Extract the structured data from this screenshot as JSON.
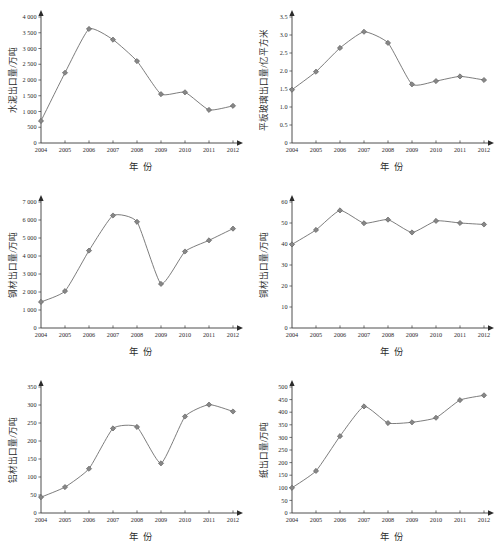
{
  "figure": {
    "background_color": "#ffffff",
    "line_color": "#6e6e6e",
    "marker_color": "#878787",
    "axis_color": "#3a3a3a",
    "panel_count": 6
  },
  "chart_data": [
    {
      "type": "line",
      "title": "",
      "xlabel": "年 份",
      "ylabel": "水泥出口量/万吨",
      "categories": [
        "2004",
        "2005",
        "2006",
        "2007",
        "2008",
        "2009",
        "2010",
        "2011",
        "2012"
      ],
      "values": [
        700,
        2230,
        3620,
        3280,
        2600,
        1550,
        1610,
        1050,
        1180
      ],
      "yticks": [
        "0",
        "500",
        "1 000",
        "1 500",
        "2 000",
        "2 500",
        "3 000",
        "3 500",
        "4 000"
      ],
      "ytick_values": [
        0,
        500,
        1000,
        1500,
        2000,
        2500,
        3000,
        3500,
        4000
      ],
      "ylim": [
        0,
        4000
      ],
      "grid": false,
      "legend": "none"
    },
    {
      "type": "line",
      "title": "",
      "xlabel": "年 份",
      "ylabel": "平板玻璃出口量/亿平方米",
      "categories": [
        "2004",
        "2005",
        "2006",
        "2007",
        "2008",
        "2009",
        "2010",
        "2011",
        "2012"
      ],
      "values": [
        1.48,
        1.98,
        2.64,
        3.09,
        2.78,
        1.63,
        1.72,
        1.85,
        1.75
      ],
      "yticks": [
        "0",
        "0.5",
        "1.0",
        "1.5",
        "2.0",
        "2.5",
        "3.0",
        "3.5"
      ],
      "ytick_values": [
        0,
        0.5,
        1.0,
        1.5,
        2.0,
        2.5,
        3.0,
        3.5
      ],
      "ylim": [
        0,
        3.5
      ],
      "grid": false,
      "legend": "none"
    },
    {
      "type": "line",
      "title": "",
      "xlabel": "年 份",
      "ylabel": "钢材出口量/万吨",
      "categories": [
        "2004",
        "2005",
        "2006",
        "2007",
        "2008",
        "2009",
        "2010",
        "2011",
        "2012"
      ],
      "values": [
        1450,
        2050,
        4300,
        6250,
        5900,
        2450,
        4250,
        4870,
        5520
      ],
      "yticks": [
        "0",
        "1 000",
        "2 000",
        "3 000",
        "4 000",
        "5 000",
        "6 000",
        "7 000"
      ],
      "ytick_values": [
        0,
        1000,
        2000,
        3000,
        4000,
        5000,
        6000,
        7000
      ],
      "ylim": [
        0,
        7000
      ],
      "grid": false,
      "legend": "none"
    },
    {
      "type": "line",
      "title": "",
      "xlabel": "年 份",
      "ylabel": "铜材出口量/万吨",
      "categories": [
        "2004",
        "2005",
        "2006",
        "2007",
        "2008",
        "2009",
        "2010",
        "2011",
        "2012"
      ],
      "values": [
        39.8,
        46.7,
        56.0,
        49.9,
        51.6,
        45.5,
        51.0,
        50.0,
        49.3
      ],
      "yticks": [
        "0",
        "10",
        "20",
        "30",
        "40",
        "50",
        "60"
      ],
      "ytick_values": [
        0,
        10,
        20,
        30,
        40,
        50,
        60
      ],
      "ylim": [
        0,
        60
      ],
      "grid": false,
      "legend": "none"
    },
    {
      "type": "line",
      "title": "",
      "xlabel": "年 份",
      "ylabel": "铝材出口量/万吨",
      "categories": [
        "2004",
        "2005",
        "2006",
        "2007",
        "2008",
        "2009",
        "2010",
        "2011",
        "2012"
      ],
      "values": [
        44,
        72,
        123,
        235,
        239,
        138,
        268,
        301,
        282
      ],
      "yticks": [
        "0",
        "50",
        "100",
        "150",
        "200",
        "250",
        "300",
        "350"
      ],
      "ytick_values": [
        0,
        50,
        100,
        150,
        200,
        250,
        300,
        350
      ],
      "ylim": [
        0,
        350
      ],
      "grid": false,
      "legend": "none"
    },
    {
      "type": "line",
      "title": "",
      "xlabel": "年 份",
      "ylabel": "纸出口量/万吨",
      "categories": [
        "2004",
        "2005",
        "2006",
        "2007",
        "2008",
        "2009",
        "2010",
        "2011",
        "2012"
      ],
      "values": [
        100,
        167,
        305,
        423,
        357,
        360,
        378,
        448,
        467
      ],
      "yticks": [
        "0",
        "50",
        "100",
        "150",
        "200",
        "250",
        "300",
        "350",
        "400",
        "450",
        "500"
      ],
      "ytick_values": [
        0,
        50,
        100,
        150,
        200,
        250,
        300,
        350,
        400,
        450,
        500
      ],
      "ylim": [
        0,
        500
      ],
      "grid": false,
      "legend": "none"
    }
  ]
}
